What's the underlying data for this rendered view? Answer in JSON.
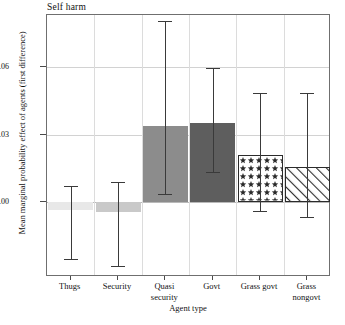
{
  "panel": {
    "title": "Self harm"
  },
  "axes": {
    "xlabel": "Agent type",
    "ylabel": "Mean marginal probability effect of agents (first difference)",
    "yticks": [
      "0.00",
      "0.03",
      "0.06"
    ]
  },
  "chart_data": {
    "type": "bar",
    "title": "Self harm",
    "xlabel": "Agent type",
    "ylabel": "Mean marginal probability effect of agents (first difference)",
    "categories": [
      "Thugs",
      "Security",
      "Quasi security",
      "Govt",
      "Grass govt",
      "Grass nongovt"
    ],
    "category_lines": [
      [
        "Thugs"
      ],
      [
        "Security"
      ],
      [
        "Quasi",
        "security"
      ],
      [
        "Govt"
      ],
      [
        "Grass govt"
      ],
      [
        "Grass",
        "nongovt"
      ]
    ],
    "values": [
      -0.0035,
      -0.0043,
      0.0339,
      0.0352,
      0.0207,
      0.0155
    ],
    "error_low": [
      -0.0255,
      -0.0285,
      0.0035,
      0.0132,
      -0.0042,
      -0.0068
    ],
    "error_high": [
      0.0073,
      0.009,
      0.0805,
      0.0594,
      0.0485,
      0.0485
    ],
    "bar_styles": [
      "solid-lightgray",
      "solid-gray",
      "solid-mediumgray",
      "solid-darkgray",
      "dotted-star",
      "diagonal-hatch"
    ],
    "bar_colors": [
      "#e8e8e8",
      "#c9c9c9",
      "#8c8c8c",
      "#5e5e5e",
      "#ffffff",
      "#ffffff"
    ],
    "yticks": [
      0.0,
      0.03,
      0.06
    ],
    "ylim": [
      -0.035,
      0.085
    ],
    "grid": true,
    "legend": "none"
  }
}
